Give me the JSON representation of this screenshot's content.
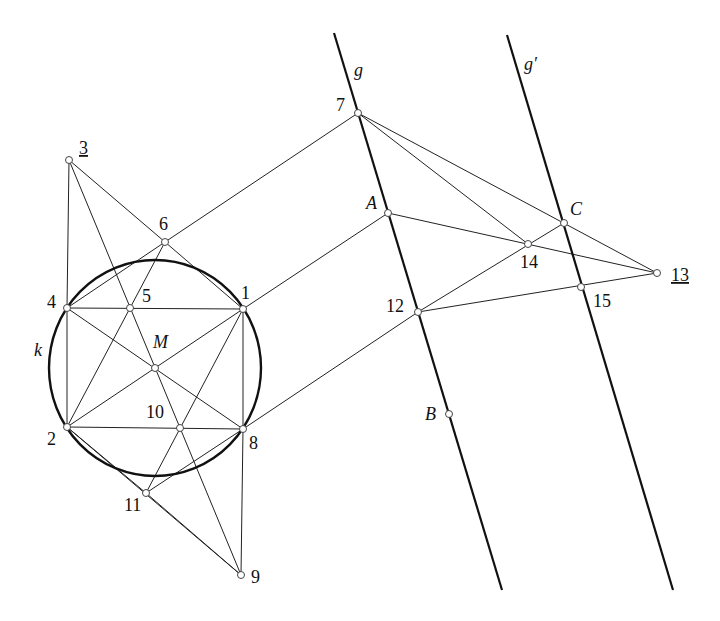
{
  "diagram": {
    "type": "projective-geometry-construction",
    "circle": {
      "name": "k",
      "label": "k",
      "cx": 155,
      "cy": 368,
      "rx": 106,
      "ry": 108
    },
    "lines": [
      {
        "name": "g",
        "label": "g",
        "x1": 334,
        "y1": 33,
        "x2": 502,
        "y2": 590
      },
      {
        "name": "g-prime",
        "label": "g′",
        "x1": 507,
        "y1": 35,
        "x2": 673,
        "y2": 590
      }
    ],
    "points": {
      "1": {
        "label": "1",
        "x": 243,
        "y": 309
      },
      "2": {
        "label": "2",
        "x": 67,
        "y": 427
      },
      "3": {
        "label": "3",
        "x": 69,
        "y": 160,
        "underlined": true
      },
      "4": {
        "label": "4",
        "x": 67,
        "y": 308
      },
      "5": {
        "label": "5",
        "x": 130,
        "y": 308
      },
      "6": {
        "label": "6",
        "x": 165,
        "y": 242
      },
      "7": {
        "label": "7",
        "x": 358,
        "y": 113
      },
      "8": {
        "label": "8",
        "x": 243,
        "y": 429
      },
      "9": {
        "label": "9",
        "x": 241,
        "y": 575
      },
      "10": {
        "label": "10",
        "x": 180,
        "y": 428
      },
      "11": {
        "label": "11",
        "x": 146,
        "y": 493
      },
      "12": {
        "label": "12",
        "x": 418,
        "y": 312
      },
      "13": {
        "label": "13",
        "x": 657,
        "y": 273,
        "underlined": true
      },
      "14": {
        "label": "14",
        "x": 528,
        "y": 244
      },
      "15": {
        "label": "15",
        "x": 581,
        "y": 287
      },
      "M": {
        "label": "M",
        "x": 155,
        "y": 368
      },
      "A": {
        "label": "A",
        "x": 388,
        "y": 213
      },
      "B": {
        "label": "B",
        "x": 449,
        "y": 414
      },
      "C": {
        "label": "C",
        "x": 564,
        "y": 223
      }
    },
    "segments": [
      [
        "3",
        "4"
      ],
      [
        "3",
        "6"
      ],
      [
        "3",
        "9"
      ],
      [
        "4",
        "2"
      ],
      [
        "4",
        "1"
      ],
      [
        "4",
        "8"
      ],
      [
        "4",
        "6"
      ],
      [
        "6",
        "1"
      ],
      [
        "6",
        "7"
      ],
      [
        "6",
        "2"
      ],
      [
        "1",
        "A"
      ],
      [
        "1",
        "2"
      ],
      [
        "1",
        "8"
      ],
      [
        "1",
        "11"
      ],
      [
        "2",
        "8"
      ],
      [
        "2",
        "9"
      ],
      [
        "8",
        "12"
      ],
      [
        "8",
        "11"
      ],
      [
        "8",
        "9"
      ],
      [
        "11",
        "9"
      ],
      [
        "11",
        "2"
      ],
      [
        "7",
        "14"
      ],
      [
        "7",
        "13"
      ],
      [
        "A",
        "13"
      ],
      [
        "12",
        "C"
      ],
      [
        "12",
        "13"
      ]
    ]
  }
}
